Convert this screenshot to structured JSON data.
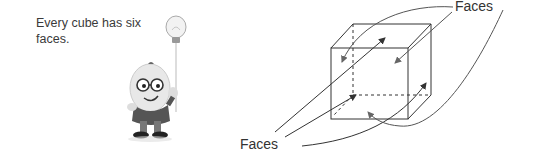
{
  "note": {
    "text": "Every cube has six faces."
  },
  "mascot": {
    "icon": "cartoon-egg-character-with-lightbulb-balloon"
  },
  "diagram": {
    "subject": "cube",
    "labels": {
      "top": "Faces",
      "bottom": "Faces"
    },
    "colors": {
      "lines": "#333333",
      "arrows": "#444444",
      "background": "#ffffff"
    }
  }
}
